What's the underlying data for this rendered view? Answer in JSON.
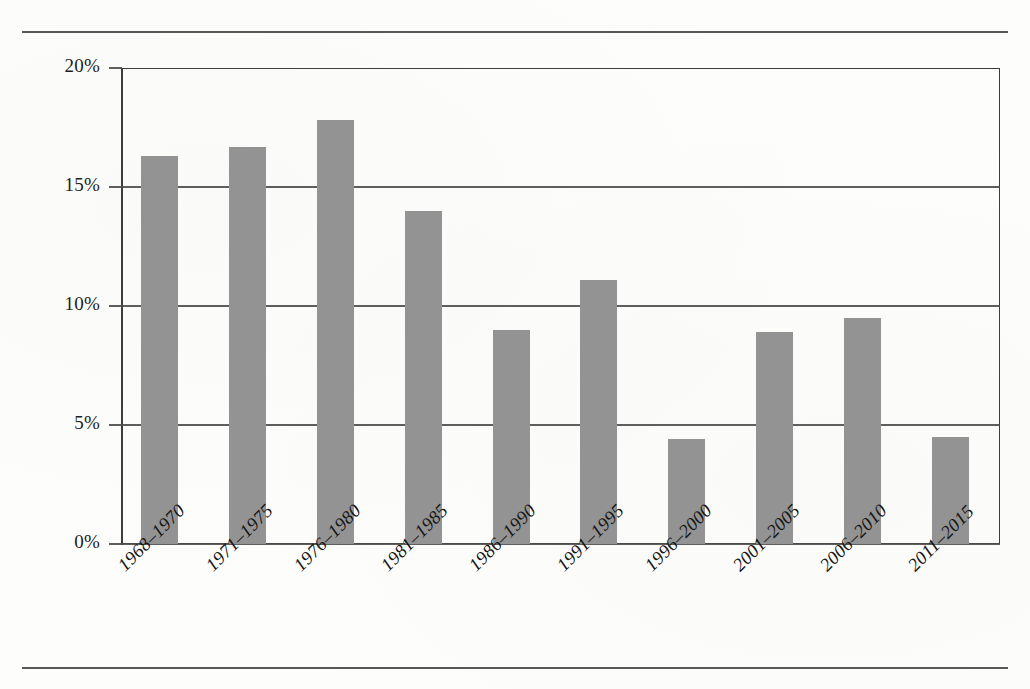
{
  "page": {
    "background_color": "#fdfdfc",
    "rule_color": "#4a4a4a",
    "top_rule": true,
    "bottom_rule": true
  },
  "chart_data": {
    "type": "bar",
    "title": "",
    "subtitle": "",
    "xlabel": "",
    "ylabel": "",
    "categories": [
      "1968–1970",
      "1971–1975",
      "1976–1980",
      "1981–1985",
      "1986–1990",
      "1991–1995",
      "1996–2000",
      "2001–2005",
      "2006–2010",
      "2011–2015"
    ],
    "values": [
      16.3,
      16.7,
      17.8,
      14.0,
      9.0,
      11.1,
      4.4,
      8.9,
      9.5,
      4.5
    ],
    "value_labels": [
      "",
      "",
      "",
      "",
      "",
      "",
      "",
      "",
      "",
      ""
    ],
    "ylim": [
      0,
      20
    ],
    "yticks": [
      0,
      5,
      10,
      15,
      20
    ],
    "ytick_labels": [
      "0%",
      "5%",
      "10%",
      "15%",
      "20%"
    ],
    "grid": true,
    "grid_axis": "y",
    "legend": false,
    "legend_position": "none",
    "bar_color": "#939393",
    "axis_color": "#3d3d3d",
    "grid_color": "#4d4d4d",
    "label_color": "#161616",
    "xtick_rotation": -45,
    "xtick_style": "italic",
    "series": [
      {
        "name": "share",
        "values": [
          16.3,
          16.7,
          17.8,
          14.0,
          9.0,
          11.1,
          4.4,
          8.9,
          9.5,
          4.5
        ]
      }
    ]
  }
}
